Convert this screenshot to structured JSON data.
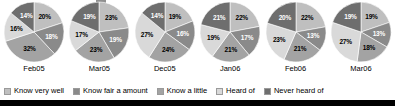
{
  "chart_data": {
    "type": "pie",
    "title": "",
    "subtitle": "",
    "xlabel": "",
    "ylabel": "",
    "legend_position": "bottom",
    "grid": false,
    "value_suffix": "%",
    "categories": [
      "Feb05",
      "Mar05",
      "Dec05",
      "Jan06",
      "Feb06",
      "Mar06"
    ],
    "series": [
      {
        "name": "Know very well",
        "color": "#bfbfbf",
        "values": [
          20,
          23,
          19,
          22,
          22,
          19
        ]
      },
      {
        "name": "Know fair a amount",
        "color": "#8a8a8a",
        "values": [
          18,
          19,
          16,
          17,
          13,
          13
        ]
      },
      {
        "name": "Know a little",
        "color": "#a3a3a3",
        "values": [
          32,
          23,
          24,
          21,
          21,
          18
        ]
      },
      {
        "name": "Heard of",
        "color": "#d9d9d9",
        "values": [
          16,
          17,
          27,
          19,
          23,
          27
        ]
      },
      {
        "name": "Never heard of",
        "color": "#6e6e6e",
        "values": [
          14,
          19,
          14,
          21,
          20,
          19
        ]
      }
    ],
    "pies": [
      {
        "label": "Feb05",
        "slices": [
          {
            "name": "Know very well",
            "value": 20,
            "display": "20%"
          },
          {
            "name": "Know fair a amount",
            "value": 18,
            "display": "18%"
          },
          {
            "name": "Know a little",
            "value": 32,
            "display": "32%"
          },
          {
            "name": "Heard of",
            "value": 16,
            "display": "16%"
          },
          {
            "name": "Never heard of",
            "value": 14,
            "display": "14%"
          }
        ]
      },
      {
        "label": "Mar05",
        "slices": [
          {
            "name": "Know very well",
            "value": 23,
            "display": "23%"
          },
          {
            "name": "Know fair a amount",
            "value": 19,
            "display": "19%"
          },
          {
            "name": "Know a little",
            "value": 23,
            "display": "23%"
          },
          {
            "name": "Heard of",
            "value": 17,
            "display": "17%"
          },
          {
            "name": "Never heard of",
            "value": 19,
            "display": "19%"
          }
        ]
      },
      {
        "label": "Dec05",
        "slices": [
          {
            "name": "Know very well",
            "value": 19,
            "display": "19%"
          },
          {
            "name": "Know fair a amount",
            "value": 16,
            "display": "16%"
          },
          {
            "name": "Know a little",
            "value": 24,
            "display": "24%"
          },
          {
            "name": "Heard of",
            "value": 27,
            "display": "27%"
          },
          {
            "name": "Never heard of",
            "value": 14,
            "display": "14%"
          }
        ]
      },
      {
        "label": "Jan06",
        "slices": [
          {
            "name": "Know very well",
            "value": 22,
            "display": "22%"
          },
          {
            "name": "Know fair a amount",
            "value": 17,
            "display": "17%"
          },
          {
            "name": "Know a little",
            "value": 21,
            "display": "21%"
          },
          {
            "name": "Heard of",
            "value": 19,
            "display": "19%"
          },
          {
            "name": "Never heard of",
            "value": 21,
            "display": "21%"
          }
        ]
      },
      {
        "label": "Feb06",
        "slices": [
          {
            "name": "Know very well",
            "value": 22,
            "display": "22%"
          },
          {
            "name": "Know fair a amount",
            "value": 13,
            "display": "13%"
          },
          {
            "name": "Know a little",
            "value": 21,
            "display": "21%"
          },
          {
            "name": "Heard of",
            "value": 23,
            "display": "23%"
          },
          {
            "name": "Never heard of",
            "value": 20,
            "display": "20%"
          }
        ]
      },
      {
        "label": "Mar06",
        "slices": [
          {
            "name": "Know very well",
            "value": 19,
            "display": "19%"
          },
          {
            "name": "Know fair a amount",
            "value": 13,
            "display": "13%"
          },
          {
            "name": "Know a little",
            "value": 18,
            "display": "18%"
          },
          {
            "name": "Heard of",
            "value": 27,
            "display": "27%"
          },
          {
            "name": "Never heard of",
            "value": 19,
            "display": "19%"
          }
        ]
      }
    ]
  },
  "legend": {
    "items": [
      {
        "label": "Know very well",
        "color": "#bfbfbf"
      },
      {
        "label": "Know fair a amount",
        "color": "#8a8a8a"
      },
      {
        "label": "Know a little",
        "color": "#a3a3a3"
      },
      {
        "label": "Heard of",
        "color": "#d9d9d9"
      },
      {
        "label": "Never heard of",
        "color": "#6e6e6e"
      }
    ]
  }
}
